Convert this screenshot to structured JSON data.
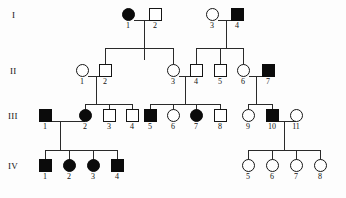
{
  "figure": {
    "type": "pedigree-chart",
    "title": "",
    "symbol_legend": {
      "square": "male",
      "circle": "female",
      "filled": "affected",
      "open": "unaffected"
    },
    "generation_labels": [
      "I",
      "II",
      "III",
      "IV"
    ],
    "colors": {
      "affected_fill": "#0b0b0b",
      "unaffected_fill": "#ffffff",
      "stroke": "#151515",
      "line": "#2a2a2a",
      "background": "#fdfdfd"
    }
  },
  "chart_data": {
    "type": "pedigree",
    "generations": [
      {
        "label": "I",
        "individuals": [
          {
            "id": "1",
            "sex": "female",
            "affected": true,
            "x": 128,
            "y": 14
          },
          {
            "id": "2",
            "sex": "male",
            "affected": false,
            "x": 155,
            "y": 14
          },
          {
            "id": "3",
            "sex": "female",
            "affected": false,
            "x": 212,
            "y": 14
          },
          {
            "id": "4",
            "sex": "male",
            "affected": true,
            "x": 237,
            "y": 14
          }
        ]
      },
      {
        "label": "II",
        "individuals": [
          {
            "id": "1",
            "sex": "female",
            "affected": false,
            "x": 82,
            "y": 70
          },
          {
            "id": "2",
            "sex": "male",
            "affected": false,
            "x": 105,
            "y": 70
          },
          {
            "id": "3",
            "sex": "female",
            "affected": false,
            "x": 173,
            "y": 70
          },
          {
            "id": "4",
            "sex": "male",
            "affected": false,
            "x": 196,
            "y": 70
          },
          {
            "id": "5",
            "sex": "male",
            "affected": false,
            "x": 220,
            "y": 70
          },
          {
            "id": "6",
            "sex": "female",
            "affected": false,
            "x": 243,
            "y": 70
          },
          {
            "id": "7",
            "sex": "male",
            "affected": true,
            "x": 268,
            "y": 70
          }
        ]
      },
      {
        "label": "III",
        "individuals": [
          {
            "id": "1",
            "sex": "male",
            "affected": true,
            "x": 45,
            "y": 115
          },
          {
            "id": "2",
            "sex": "female",
            "affected": true,
            "x": 85,
            "y": 115
          },
          {
            "id": "3",
            "sex": "male",
            "affected": false,
            "x": 109,
            "y": 115
          },
          {
            "id": "4",
            "sex": "male",
            "affected": false,
            "x": 132,
            "y": 115
          },
          {
            "id": "5",
            "sex": "male",
            "affected": true,
            "x": 150,
            "y": 115
          },
          {
            "id": "6",
            "sex": "female",
            "affected": false,
            "x": 173,
            "y": 115
          },
          {
            "id": "7",
            "sex": "female",
            "affected": true,
            "x": 196,
            "y": 115
          },
          {
            "id": "8",
            "sex": "male",
            "affected": false,
            "x": 220,
            "y": 115
          },
          {
            "id": "9",
            "sex": "female",
            "affected": false,
            "x": 248,
            "y": 115
          },
          {
            "id": "10",
            "sex": "male",
            "affected": true,
            "x": 272,
            "y": 115
          },
          {
            "id": "11",
            "sex": "female",
            "affected": false,
            "x": 296,
            "y": 115
          }
        ]
      },
      {
        "label": "IV",
        "individuals": [
          {
            "id": "1",
            "sex": "male",
            "affected": true,
            "x": 45,
            "y": 165
          },
          {
            "id": "2",
            "sex": "female",
            "affected": true,
            "x": 69,
            "y": 165
          },
          {
            "id": "3",
            "sex": "female",
            "affected": true,
            "x": 93,
            "y": 165
          },
          {
            "id": "4",
            "sex": "male",
            "affected": true,
            "x": 117,
            "y": 165
          },
          {
            "id": "5",
            "sex": "female",
            "affected": false,
            "x": 248,
            "y": 165
          },
          {
            "id": "6",
            "sex": "female",
            "affected": false,
            "x": 272,
            "y": 165
          },
          {
            "id": "7",
            "sex": "female",
            "affected": false,
            "x": 296,
            "y": 165
          },
          {
            "id": "8",
            "sex": "female",
            "affected": false,
            "x": 320,
            "y": 165
          }
        ]
      }
    ],
    "matings": [
      {
        "partners": [
          "I-1",
          "I-2"
        ],
        "children": [
          "II-2",
          "II-3"
        ]
      },
      {
        "partners": [
          "I-3",
          "I-4"
        ],
        "children": [
          "II-4",
          "II-5",
          "II-6"
        ]
      },
      {
        "partners": [
          "II-1",
          "II-2"
        ],
        "children": [
          "III-2",
          "III-3",
          "III-4"
        ]
      },
      {
        "partners": [
          "II-3",
          "II-4"
        ],
        "children": [
          "III-5",
          "III-6",
          "III-7",
          "III-8"
        ]
      },
      {
        "partners": [
          "II-6",
          "II-7"
        ],
        "children": [
          "III-9",
          "III-10"
        ]
      },
      {
        "partners": [
          "III-1",
          "III-2"
        ],
        "children": [
          "IV-1",
          "IV-2",
          "IV-3",
          "IV-4"
        ]
      },
      {
        "partners": [
          "III-10",
          "III-11"
        ],
        "children": [
          "IV-5",
          "IV-6",
          "IV-7",
          "IV-8"
        ]
      }
    ],
    "counts": {
      "total_individuals": 30,
      "affected_total": 12,
      "generation_I": 4,
      "generation_II": 7,
      "generation_III": 11,
      "generation_IV": 8
    }
  }
}
